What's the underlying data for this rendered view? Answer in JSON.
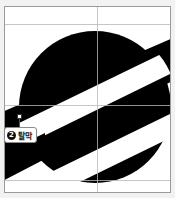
{
  "canvas": {
    "background": "#ffffff",
    "frame_color": "#9a9a9a"
  },
  "artwork": {
    "subject": "planet-with-ring",
    "fill_color": "#000000",
    "band_color": "#ffffff"
  },
  "guides": {
    "vertical_x": [
      92
    ],
    "horizontal_y": [
      17,
      98,
      173
    ]
  },
  "smart_label": {
    "number": "2",
    "text": "탈막"
  }
}
